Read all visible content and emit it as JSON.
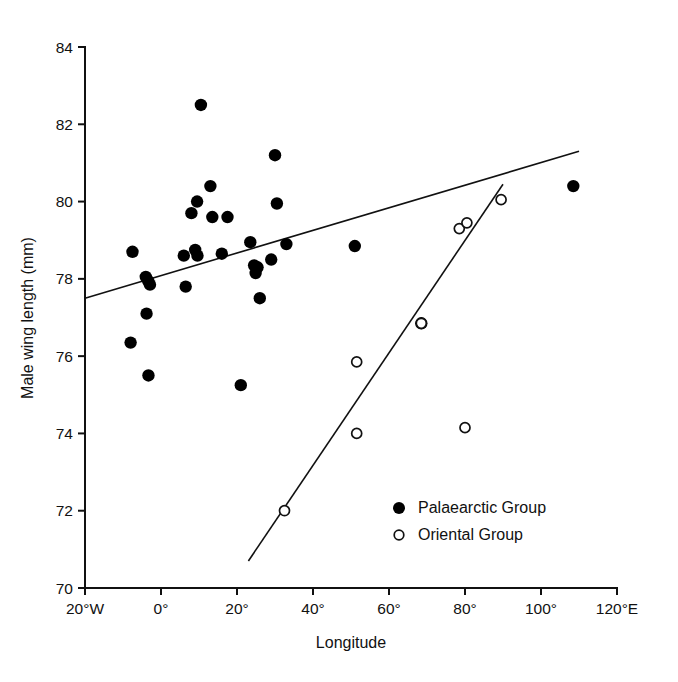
{
  "chart_data": {
    "type": "scatter",
    "title": "",
    "xlabel": "Longitude",
    "ylabel": "Male wing length  (mm)",
    "xlim": [
      -20,
      120
    ],
    "ylim": [
      70,
      84
    ],
    "grid": false,
    "legend_position": "bottom-right",
    "x_tick_values": [
      -20,
      0,
      20,
      40,
      60,
      80,
      100,
      120
    ],
    "x_tick_labels": [
      "20°W",
      "0°",
      "20°",
      "40°",
      "60°",
      "80°",
      "100°",
      "120°E"
    ],
    "y_tick_values": [
      70,
      72,
      74,
      76,
      78,
      80,
      82,
      84
    ],
    "y_tick_labels": [
      "70",
      "72",
      "74",
      "76",
      "78",
      "80",
      "82",
      "84"
    ],
    "series": [
      {
        "name": "Palaearctic Group",
        "marker": "filled-circle",
        "color": "#000000",
        "points": [
          [
            -7.5,
            78.7
          ],
          [
            -8.0,
            76.35
          ],
          [
            -4.0,
            78.05
          ],
          [
            -3.4,
            77.95
          ],
          [
            -2.9,
            77.85
          ],
          [
            -3.8,
            77.1
          ],
          [
            -3.3,
            75.5
          ],
          [
            6.0,
            78.6
          ],
          [
            6.5,
            77.8
          ],
          [
            8.0,
            79.7
          ],
          [
            9.5,
            80.0
          ],
          [
            9.0,
            78.75
          ],
          [
            9.6,
            78.6
          ],
          [
            10.5,
            82.5
          ],
          [
            13.0,
            80.4
          ],
          [
            13.5,
            79.6
          ],
          [
            16.0,
            78.65
          ],
          [
            17.5,
            79.6
          ],
          [
            21.0,
            75.25
          ],
          [
            23.5,
            78.95
          ],
          [
            24.5,
            78.35
          ],
          [
            24.9,
            78.15
          ],
          [
            25.4,
            78.3
          ],
          [
            26.0,
            77.5
          ],
          [
            29.0,
            78.5
          ],
          [
            30.0,
            81.2
          ],
          [
            30.5,
            79.95
          ],
          [
            33.0,
            78.9
          ],
          [
            51.0,
            78.85
          ],
          [
            68.5,
            76.85
          ],
          [
            108.5,
            80.4
          ]
        ]
      },
      {
        "name": "Oriental Group",
        "marker": "open-circle",
        "color": "#111111",
        "points": [
          [
            32.5,
            72.0
          ],
          [
            51.5,
            74.0
          ],
          [
            51.5,
            75.85
          ],
          [
            68.5,
            76.85
          ],
          [
            78.5,
            79.3
          ],
          [
            80.5,
            79.45
          ],
          [
            80.0,
            74.15
          ],
          [
            89.5,
            80.05
          ]
        ]
      }
    ],
    "fit_lines": [
      {
        "name": "Palaearctic regression line",
        "x0": -20.0,
        "y0": 77.5,
        "x1": 110.0,
        "y1": 81.3
      },
      {
        "name": "Oriental regression line",
        "x0": 23.0,
        "y0": 70.7,
        "x1": 90.0,
        "y1": 80.45
      }
    ]
  },
  "legend": {
    "items": [
      {
        "label": "Palaearctic Group",
        "marker": "filled-circle"
      },
      {
        "label": "Oriental Group",
        "marker": "open-circle"
      }
    ]
  },
  "axes": {
    "x_title": "Longitude",
    "y_title": "Male wing length  (mm)"
  }
}
